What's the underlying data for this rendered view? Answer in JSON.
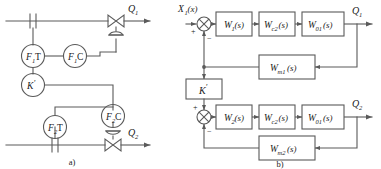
{
  "figure": {
    "panel_a": {
      "caption": "a)",
      "title_semantic": "ratio-control-piping-scheme",
      "instruments": [
        {
          "id": "f1t",
          "label_main": "F",
          "label_sub": "1",
          "label_tail": "T"
        },
        {
          "id": "f1c",
          "label_main": "F",
          "label_sub": "1",
          "label_tail": "C"
        },
        {
          "id": "kprime",
          "label_main": "K",
          "label_sub": "",
          "label_tail": "′"
        },
        {
          "id": "f2t",
          "label_main": "F",
          "label_sub": "2",
          "label_tail": "T"
        },
        {
          "id": "f2c",
          "label_main": "F",
          "label_sub": "2",
          "label_tail": "C"
        }
      ],
      "flows": [
        {
          "id": "q1",
          "label_main": "Q",
          "label_sub": "1"
        },
        {
          "id": "q2",
          "label_main": "Q",
          "label_sub": "2"
        }
      ]
    },
    "panel_b": {
      "caption": "b)",
      "title_semantic": "equivalent-block-diagram",
      "input": {
        "label_main": "X",
        "label_sub": "1",
        "label_arg": "(x)"
      },
      "gain_block": {
        "label_main": "K",
        "label_tail": "′"
      },
      "signs": {
        "plus": "+",
        "minus": "−"
      },
      "loop_top": {
        "blocks": [
          {
            "id": "w1",
            "main": "W",
            "sub": "1",
            "arg": "(s)"
          },
          {
            "id": "wc2_top",
            "main": "W",
            "sub": "c2",
            "arg": "(s)"
          },
          {
            "id": "w01_top",
            "main": "W",
            "sub": "01",
            "arg": "(s)"
          }
        ],
        "feedback": {
          "id": "wm1",
          "main": "W",
          "sub": "m1",
          "arg": "(s)"
        },
        "output": {
          "label_main": "Q",
          "label_sub": "1"
        }
      },
      "loop_bottom": {
        "blocks": [
          {
            "id": "w2",
            "main": "W",
            "sub": "2",
            "arg": "(s)"
          },
          {
            "id": "wc2_bot",
            "main": "W",
            "sub": "c2",
            "arg": "(s)"
          },
          {
            "id": "w01_bot",
            "main": "W",
            "sub": "01",
            "arg": "(s)"
          }
        ],
        "feedback": {
          "id": "wm2",
          "main": "W",
          "sub": "m2",
          "arg": "(s)"
        },
        "output": {
          "label_main": "Q",
          "label_sub": "2"
        }
      }
    },
    "colors": {
      "line": "#5a5a5a",
      "text": "#1a1a1a",
      "background": "#ffffff"
    }
  }
}
